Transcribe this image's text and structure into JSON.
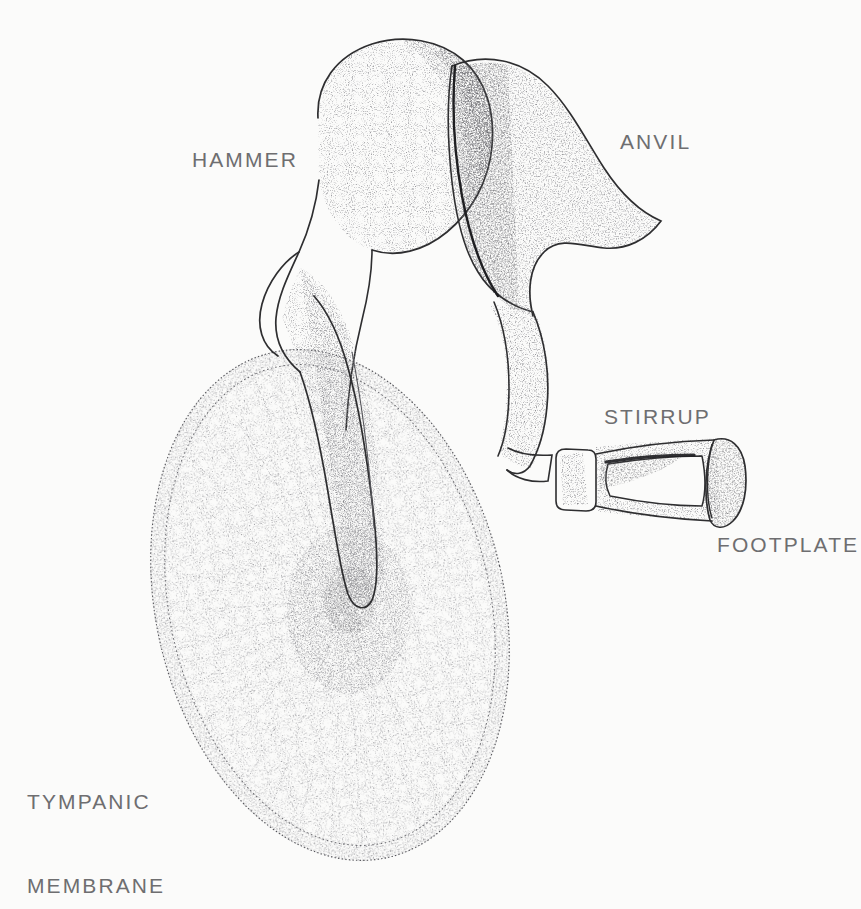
{
  "figure": {
    "kind": "anatomical-line-illustration",
    "technique": "pen-and-ink stipple drawing",
    "background_color": "#fbfbfa",
    "ink_color": "#3a3a3c",
    "label_color": "#6e6e70"
  },
  "labels": {
    "hammer": "HAMMER",
    "anvil": "ANVIL",
    "stirrup": "STIRRUP",
    "footplate": "FOOTPLATE",
    "tympanic_line1": "TYMPANIC",
    "tympanic_line2": "MEMBRANE"
  },
  "structures": [
    {
      "name": "hammer",
      "label": "HAMMER"
    },
    {
      "name": "anvil",
      "label": "ANVIL"
    },
    {
      "name": "stirrup",
      "label": "STIRRUP"
    },
    {
      "name": "footplate",
      "label": "FOOTPLATE"
    },
    {
      "name": "tympanic-membrane",
      "label": "TYMPANIC MEMBRANE"
    }
  ]
}
